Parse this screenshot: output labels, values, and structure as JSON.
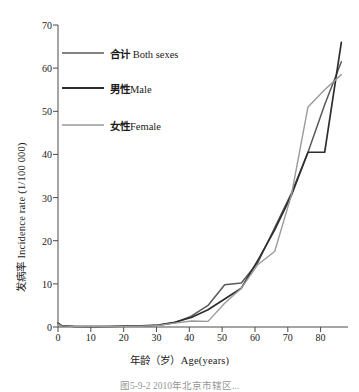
{
  "figure": {
    "background": "#ffffff",
    "caption_partial": "图5-9-2 2010年北京市辖区..."
  },
  "chart_data": {
    "type": "line",
    "title": "",
    "xlabel": "年龄（岁）Age(years)",
    "ylabel": "发病率 Incidence rate (1/100 000)",
    "xlim": [
      0,
      87
    ],
    "ylim": [
      0,
      70
    ],
    "grid": false,
    "legend_position": "upper-left",
    "xticks": [
      0,
      10,
      20,
      30,
      40,
      50,
      60,
      70,
      80
    ],
    "yticks": [
      0,
      10,
      20,
      30,
      40,
      50,
      60,
      70
    ],
    "x": [
      0,
      1,
      5,
      10,
      15,
      20,
      25,
      30,
      35,
      40,
      45,
      50,
      55,
      60,
      65,
      70,
      75,
      80,
      85
    ],
    "series": [
      {
        "name": "合计 Both sexes",
        "label_cn": "合计",
        "label_en": "Both sexes",
        "color": "#595959",
        "width": 1.5,
        "values": [
          0.8,
          0.3,
          0.1,
          0.1,
          0.1,
          0.15,
          0.2,
          0.4,
          1.0,
          2.5,
          5.0,
          9.8,
          10.2,
          15.0,
          23.0,
          31.0,
          40.5,
          51.5,
          61.5
        ]
      },
      {
        "name": "男性 Male",
        "label_cn": "男性",
        "label_en": "Male",
        "color": "#2e2e2e",
        "width": 1.7,
        "values": [
          0.9,
          0.35,
          0.12,
          0.1,
          0.12,
          0.18,
          0.25,
          0.45,
          1.1,
          2.2,
          4.0,
          6.5,
          9.0,
          15.5,
          22.5,
          30.5,
          40.5,
          40.5,
          66.0
        ]
      },
      {
        "name": "女性 Female",
        "label_cn": "女性",
        "label_en": "Female",
        "color": "#9a9a9a",
        "width": 1.4,
        "values": [
          0.7,
          0.25,
          0.08,
          0.08,
          0.1,
          0.12,
          0.18,
          0.35,
          0.9,
          1.4,
          1.3,
          5.5,
          9.0,
          14.5,
          17.5,
          30.5,
          51.0,
          55.0,
          58.5
        ]
      }
    ]
  },
  "legend": {
    "items": [
      {
        "cn": "合计 ",
        "en": "Both sexes",
        "color": "#595959"
      },
      {
        "cn": "男性",
        "en": "Male",
        "color": "#2e2e2e"
      },
      {
        "cn": "女性",
        "en": "Female",
        "color": "#9a9a9a"
      }
    ]
  },
  "axis": {
    "y_ticks": [
      "0",
      "10",
      "20",
      "30",
      "40",
      "50",
      "60",
      "70"
    ],
    "x_ticks": [
      "0",
      "10",
      "20",
      "30",
      "40",
      "50",
      "60",
      "70",
      "80"
    ],
    "y_title": "发病率 Incidence rate (1/100 000)",
    "x_title": "年龄（岁）Age(years)"
  }
}
